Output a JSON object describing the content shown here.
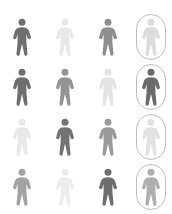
{
  "canvas": {
    "width": 172,
    "height": 214,
    "background": "#ffffff"
  },
  "legend": {
    "icon_name": "person-pictogram",
    "highlight_shape": "rounded-rectangle-pill",
    "highlight_border_color": "#bdbdbd",
    "description": "4 by 4 grid of person pictograms in varying gray tones; fourth column figures are enclosed in rounded pill outlines"
  },
  "palette": {
    "dark": "#6e6e6e",
    "dark_alt": "#6a6a6a",
    "medium_dark": "#808080",
    "medium": "#909090",
    "medium_light": "#a8a8a8",
    "light": "#d9d9d9",
    "very_light": "#eaeaea",
    "pale": "#e4e4e4"
  },
  "grid": {
    "columns": 4,
    "rows": 4,
    "cells": [
      [
        {
          "id": "r1c1",
          "tone": "dark",
          "color": "#6e6e6e",
          "highlighted": false,
          "label": "person"
        },
        {
          "id": "r1c2",
          "tone": "very_light",
          "color": "#e8e8e8",
          "highlighted": false,
          "label": "person"
        },
        {
          "id": "r1c3",
          "tone": "medium",
          "color": "#8e8e8e",
          "highlighted": false,
          "label": "person"
        },
        {
          "id": "r1c4",
          "tone": "light",
          "color": "#dcdcdc",
          "highlighted": true,
          "label": "person"
        }
      ],
      [
        {
          "id": "r2c1",
          "tone": "dark",
          "color": "#6e6e6e",
          "highlighted": false,
          "label": "person"
        },
        {
          "id": "r2c2",
          "tone": "medium",
          "color": "#949494",
          "highlighted": false,
          "label": "person"
        },
        {
          "id": "r2c3",
          "tone": "very_light",
          "color": "#e4e4e4",
          "highlighted": false,
          "label": "person"
        },
        {
          "id": "r2c4",
          "tone": "dark",
          "color": "#6a6a6a",
          "highlighted": true,
          "label": "person"
        }
      ],
      [
        {
          "id": "r3c1",
          "tone": "very_light",
          "color": "#e8e8e8",
          "highlighted": false,
          "label": "person"
        },
        {
          "id": "r3c2",
          "tone": "dark",
          "color": "#737373",
          "highlighted": false,
          "label": "person"
        },
        {
          "id": "r3c3",
          "tone": "medium",
          "color": "#9a9a9a",
          "highlighted": false,
          "label": "person"
        },
        {
          "id": "r3c4",
          "tone": "very_light",
          "color": "#e2e2e2",
          "highlighted": true,
          "label": "person"
        }
      ],
      [
        {
          "id": "r4c1",
          "tone": "medium_light",
          "color": "#a2a2a2",
          "highlighted": false,
          "label": "person"
        },
        {
          "id": "r4c2",
          "tone": "very_light",
          "color": "#ececec",
          "highlighted": false,
          "label": "person"
        },
        {
          "id": "r4c3",
          "tone": "dark",
          "color": "#6e6e6e",
          "highlighted": false,
          "label": "person"
        },
        {
          "id": "r4c4",
          "tone": "medium_light",
          "color": "#aeaeae",
          "highlighted": true,
          "label": "person"
        }
      ]
    ]
  }
}
